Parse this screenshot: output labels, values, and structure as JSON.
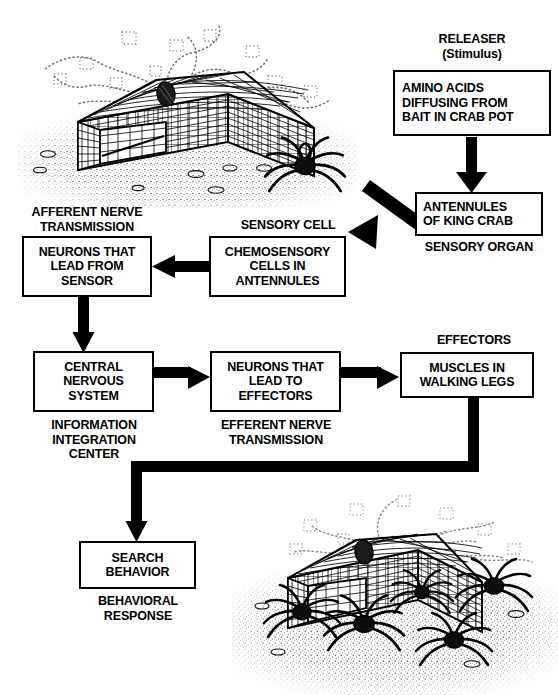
{
  "diagram": {
    "ink_color": "#000000",
    "background_color": "#ffffff"
  },
  "boxes": [
    {
      "id": "releaser",
      "text": "AMINO ACIDS\nDIFFUSING FROM\nBAIT IN CRAB POT"
    },
    {
      "id": "sensory_organ",
      "text": "ANTENNULES\nOF KING CRAB"
    },
    {
      "id": "sensory_cell",
      "text": "CHEMOSENSORY\nCELLS IN\nANTENNULES"
    },
    {
      "id": "afferent",
      "text": "NEURONS THAT\nLEAD FROM\nSENSOR"
    },
    {
      "id": "cns",
      "text": "CENTRAL\nNERVOUS\nSYSTEM"
    },
    {
      "id": "efferent",
      "text": "NEURONS THAT\nLEAD TO\nEFFECTORS"
    },
    {
      "id": "effectors",
      "text": "MUSCLES IN\nWALKING LEGS"
    },
    {
      "id": "behavior",
      "text": "SEARCH\nBEHAVIOR"
    }
  ],
  "labels": {
    "releaser": "RELEASER\n(Stimulus)",
    "sensory_organ": "SENSORY ORGAN",
    "sensory_cell": "SENSORY CELL",
    "afferent": "AFFERENT NERVE\nTRANSMISSION",
    "cns": "INFORMATION\nINTEGRATION\nCENTER",
    "efferent": "EFFERENT NERVE\nTRANSMISSION",
    "effectors": "EFFECTORS",
    "behavior": "BEHAVIORAL\nRESPONSE"
  },
  "illustrations": {
    "top": {
      "name": "crab-pot-with-single-crab",
      "caption": "Wire mesh crab pot resting on the sea floor with bait inside, amino acid molecules diffusing away as dotted trails, and one king crab approaching from the right."
    },
    "bottom": {
      "name": "crab-pot-swarmed-by-crabs",
      "caption": "The same crab pot now surrounded and entered by several king crabs that have followed the amino acid trail."
    }
  },
  "flow": [
    {
      "from": "releaser",
      "to": "sensory_organ",
      "style": "straight-down"
    },
    {
      "from": "sensory_organ",
      "to": "sensory_cell",
      "style": "diagonal-down-left"
    },
    {
      "from": "sensory_cell",
      "to": "afferent",
      "style": "straight-left"
    },
    {
      "from": "afferent",
      "to": "cns",
      "style": "straight-down"
    },
    {
      "from": "cns",
      "to": "efferent",
      "style": "straight-right"
    },
    {
      "from": "efferent",
      "to": "effectors",
      "style": "straight-right"
    },
    {
      "from": "effectors",
      "to": "behavior",
      "style": "elbow-down-left-down"
    }
  ]
}
